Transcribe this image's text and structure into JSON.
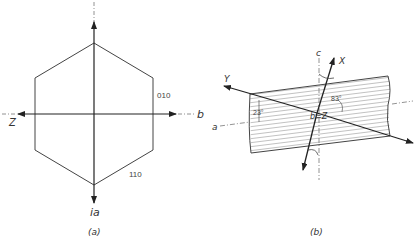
{
  "figure_a": {
    "caption": "(a)",
    "axis_labels": {
      "top_bottom": "ia",
      "right": "b",
      "left": "Z"
    },
    "face_labels": {
      "upper_right": "010",
      "lower_right": "110"
    },
    "shape": "hexagon"
  },
  "figure_b": {
    "caption": "(b)",
    "axis_labels": {
      "c": "c",
      "x": "X",
      "y": "Y",
      "a": "a",
      "center": "b=Z"
    },
    "angles": {
      "left": "23°",
      "right": "83°"
    },
    "shape": "hatched crystal slab"
  },
  "colors": {
    "line": "#333333",
    "hatch": "#888888",
    "background": "#ffffff"
  }
}
